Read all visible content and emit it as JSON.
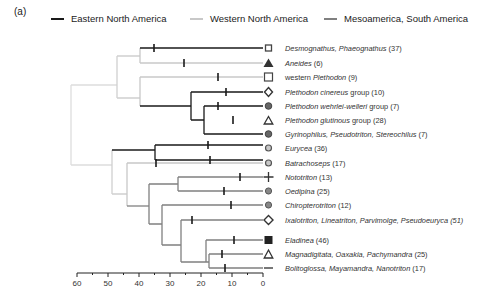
{
  "panel_label": "(a)",
  "colors": {
    "eastern": "#1a1a1a",
    "western": "#c8c8c8",
    "meso": "#808080",
    "root": "#dddddd",
    "text": "#333333"
  },
  "legend": [
    {
      "label": "Eastern North America",
      "color_key": "eastern"
    },
    {
      "label": "Western North America",
      "color_key": "western"
    },
    {
      "label": "Mesoamerica, South America",
      "color_key": "meso"
    }
  ],
  "axis": {
    "ticks": [
      "60",
      "50",
      "40",
      "30",
      "20",
      "10",
      "0"
    ],
    "min": 0,
    "max": 60
  },
  "taxa": [
    {
      "name": "Desmognathus, Phaeognathus",
      "count": "(37)",
      "marker": "square-small",
      "region": "eastern"
    },
    {
      "name": "Aneides",
      "count": "(6)",
      "marker": "triangle-filled",
      "region": "western"
    },
    {
      "name_pre": "western ",
      "name": "Plethodon",
      "count": "(9)",
      "marker": "square-open",
      "region": "western"
    },
    {
      "name": "Plethodon cinereus",
      "name_post": " group",
      "count": "(10)",
      "marker": "diamond-open",
      "region": "eastern"
    },
    {
      "name": "Plethodon wehrlei-welleri",
      "name_post": " group",
      "count": "(7)",
      "marker": "circle-filled",
      "region": "eastern"
    },
    {
      "name": "Plethodon glutinous",
      "name_post": " group",
      "count": "(28)",
      "marker": "triangle-open",
      "region": "eastern"
    },
    {
      "name": "Gyrinophilus, Pseudotriton, Stereochilus",
      "count": "(7)",
      "marker": "circle-filled",
      "region": "eastern"
    },
    {
      "name": "Eurycea",
      "count": "(36)",
      "marker": "circle-open",
      "region": "eastern"
    },
    {
      "name": "Batrachoseps",
      "count": "(17)",
      "marker": "circle-open",
      "region": "western"
    },
    {
      "name": "Nototriton",
      "count": "(13)",
      "marker": "plus",
      "region": "meso"
    },
    {
      "name": "Oedipina",
      "count": "(25)",
      "marker": "circle-filled",
      "region": "meso"
    },
    {
      "name": "Chiropterotriton",
      "count": "(12)",
      "marker": "circle-filled",
      "region": "meso"
    },
    {
      "name": "Ixalotriton, Lineatriton, Parvimolge, Pseudoeuryca",
      "count": "(51)",
      "marker": "diamond-open",
      "region": "meso",
      "count_italic": true
    },
    {
      "name": "Eladinea",
      "count": "(46)",
      "marker": "square-filled",
      "region": "meso"
    },
    {
      "name": "Magnadigitata, Oaxakia, Pachymandra",
      "count": "(25)",
      "marker": "triangle-open",
      "region": "meso"
    },
    {
      "name": "Bolitoglossa, Mayamandra, Nanotriton",
      "count": "(17)",
      "marker": "dash",
      "region": "meso"
    }
  ]
}
